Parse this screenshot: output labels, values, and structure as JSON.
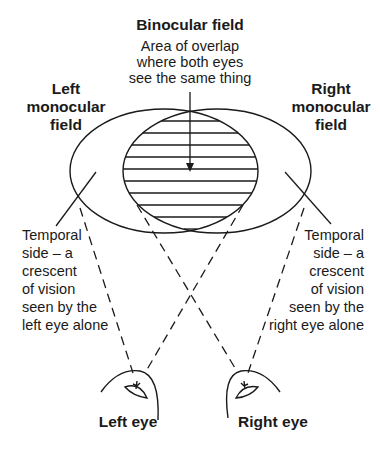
{
  "binocular": {
    "title": "Binocular field",
    "desc_lines": [
      "Area of overlap",
      "where both eyes",
      "see the same thing"
    ]
  },
  "left_field": {
    "title_lines": [
      "Left",
      "monocular",
      "field"
    ]
  },
  "right_field": {
    "title_lines": [
      "Right",
      "monocular",
      "field"
    ]
  },
  "left_temporal": {
    "lines": [
      "Temporal",
      "side – a",
      "crescent",
      "of vision",
      "seen by the",
      "left eye alone"
    ]
  },
  "right_temporal": {
    "lines": [
      "Temporal",
      "side – a",
      "crescent",
      "of vision",
      "seen by the",
      "right eye alone"
    ]
  },
  "eyes": {
    "left": "Left eye",
    "right": "Right eye"
  }
}
